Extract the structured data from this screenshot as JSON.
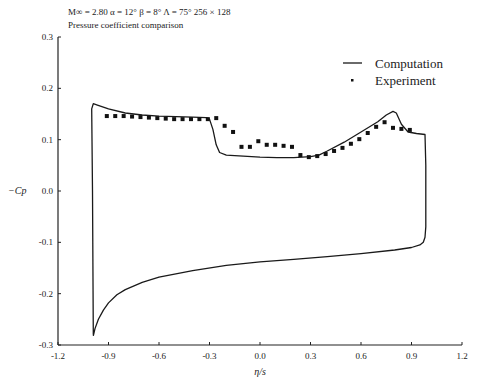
{
  "header": {
    "conditions": "M∞ = 2.80   α = 12°   β = 8°   Λ = 75°   256 × 128",
    "subtitle": "Pressure coefficient comparison"
  },
  "chart_data": {
    "type": "line",
    "title": "Pressure coefficient comparison",
    "subtitle": "M∞ = 2.80  α = 12°  β = 8°  Λ = 75°  256 × 128",
    "xlabel": "η/s",
    "ylabel": "−Cp",
    "xlim": [
      -1.2,
      1.2
    ],
    "ylim": [
      -0.3,
      0.3
    ],
    "xticks": [
      -1.2,
      -0.9,
      -0.6,
      -0.3,
      0.0,
      0.3,
      0.6,
      0.9,
      1.2
    ],
    "xtick_labels": [
      "-1.2",
      "-0.9",
      "-0.6",
      "-0.3",
      "0.0",
      "0.3",
      "0.6",
      "0.9",
      "1.2"
    ],
    "yticks": [
      0.3,
      0.2,
      0.1,
      0.0,
      -0.1,
      -0.2,
      -0.3
    ],
    "ytick_labels": [
      "0.3",
      "0.2",
      "0.1",
      "0.0",
      "-0.1",
      "-0.2",
      "-0.3"
    ],
    "grid": false,
    "legend_position": "upper right",
    "legend": [
      "Computation",
      "Experiment"
    ],
    "series": [
      {
        "name": "Computation",
        "style": "line",
        "x": [
          -0.99,
          -0.995,
          -1.0,
          -0.99,
          -0.97,
          -0.9,
          -0.8,
          -0.7,
          -0.6,
          -0.5,
          -0.4,
          -0.32,
          -0.3,
          -0.28,
          -0.26,
          -0.24,
          -0.2,
          -0.1,
          0.0,
          0.1,
          0.2,
          0.3,
          0.35,
          0.4,
          0.5,
          0.6,
          0.7,
          0.75,
          0.79,
          0.81,
          0.84,
          0.88,
          0.93,
          0.98,
          0.985,
          0.985,
          0.98,
          0.97,
          0.95,
          0.9,
          0.8,
          0.6,
          0.4,
          0.2,
          0.0,
          -0.2,
          -0.4,
          -0.6,
          -0.7,
          -0.8,
          -0.85,
          -0.9,
          -0.93,
          -0.96,
          -0.98,
          -0.99
        ],
        "y": [
          -0.28,
          0.0,
          0.16,
          0.17,
          0.168,
          0.16,
          0.152,
          0.148,
          0.146,
          0.145,
          0.144,
          0.143,
          0.14,
          0.12,
          0.09,
          0.075,
          0.07,
          0.068,
          0.066,
          0.065,
          0.065,
          0.067,
          0.07,
          0.078,
          0.095,
          0.115,
          0.135,
          0.148,
          0.155,
          0.152,
          0.13,
          0.115,
          0.112,
          0.11,
          0.05,
          -0.07,
          -0.09,
          -0.1,
          -0.105,
          -0.11,
          -0.115,
          -0.122,
          -0.128,
          -0.133,
          -0.138,
          -0.145,
          -0.155,
          -0.168,
          -0.178,
          -0.192,
          -0.202,
          -0.218,
          -0.232,
          -0.25,
          -0.268,
          -0.282
        ]
      },
      {
        "name": "Experiment",
        "style": "markers",
        "x": [
          -0.91,
          -0.86,
          -0.81,
          -0.76,
          -0.71,
          -0.66,
          -0.61,
          -0.56,
          -0.51,
          -0.46,
          -0.41,
          -0.36,
          -0.31,
          -0.26,
          -0.21,
          -0.16,
          -0.11,
          -0.06,
          -0.01,
          0.04,
          0.09,
          0.14,
          0.19,
          0.24,
          0.29,
          0.34,
          0.39,
          0.44,
          0.49,
          0.54,
          0.59,
          0.64,
          0.69,
          0.74,
          0.79,
          0.84,
          0.89
        ],
        "y": [
          0.146,
          0.146,
          0.146,
          0.145,
          0.144,
          0.143,
          0.142,
          0.141,
          0.14,
          0.14,
          0.14,
          0.14,
          0.14,
          0.142,
          0.127,
          0.115,
          0.086,
          0.086,
          0.097,
          0.09,
          0.09,
          0.088,
          0.086,
          0.07,
          0.066,
          0.068,
          0.072,
          0.078,
          0.084,
          0.092,
          0.101,
          0.113,
          0.125,
          0.134,
          0.123,
          0.121,
          0.119
        ]
      }
    ]
  }
}
